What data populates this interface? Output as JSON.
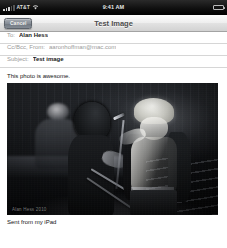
{
  "device": {
    "status_bar": {
      "carrier": "AT&T",
      "wifi_icon": "wifi-icon",
      "signal_icon": "signal-bars-icon",
      "time": "9:41 AM",
      "battery_icon": "battery-icon",
      "battery_level_percent": 88
    }
  },
  "nav_bar": {
    "cancel_label": "Cancel",
    "title": "Test Image"
  },
  "compose": {
    "fields": [
      {
        "label": "To:",
        "value": "Alan Hess",
        "muted": false
      },
      {
        "label": "Cc/Bcc, From:",
        "value": "aaronhoffman@mac.com",
        "muted": true
      },
      {
        "label": "Subject:",
        "value": "Test image",
        "muted": false
      }
    ],
    "body_text": "This photo is awesome.",
    "attachment": {
      "name": "concert-photo",
      "watermark": "Alan Hess 2010",
      "alt": "Black and white concert photo of a guitarist and a singer at a microphone on stage"
    },
    "signature": "Sent from my iPad"
  },
  "colors": {
    "nav_title": "#4d4d4d",
    "field_label": "#9a9a9a",
    "field_value": "#1b1b1b",
    "caret": "#3a7fe0",
    "status_bar_bg": "#000000"
  }
}
